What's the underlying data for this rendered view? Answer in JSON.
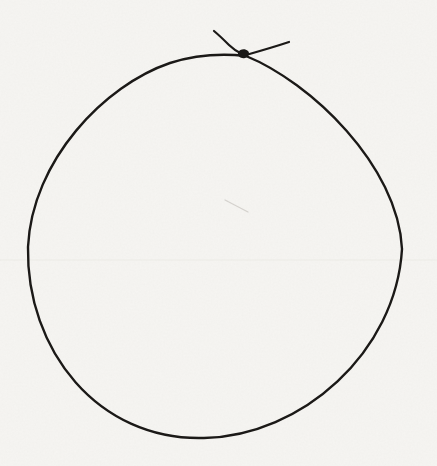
{
  "colors": {
    "paper": "#f6f5f2",
    "ink": "#1b1917",
    "smudge": "#b9b6b1",
    "scan_band": "#e3e1db"
  },
  "drawing": {
    "canvas_width": "437",
    "canvas_height": "466",
    "loop_stroke_width": "2.4",
    "tail_stroke_width": "2.2",
    "smudge_stroke_width": "1.2",
    "band_stroke_width": "1.6",
    "loop_path": "M246 56 C218 53 192 56 170 63 C105 85 32 160 28 247 C26 350 98 441 204 438 C302 436 396 352 402 249 C398 165 310 82 246 56",
    "tail_left_path": "M214 31 C220 36 225 41 229 45 C234 50 238 52 242 54",
    "tail_right_path": "M246 55 C260 51 274 47 289 42",
    "knot_path": "M238 52 C240 49 245 48 248 51 C250 53 249 57 245 58 C241 59 237 56 238 52 Z",
    "smudge_path": "M225 200 L248 212",
    "scan_band_path": "M0 260 L437 260"
  }
}
